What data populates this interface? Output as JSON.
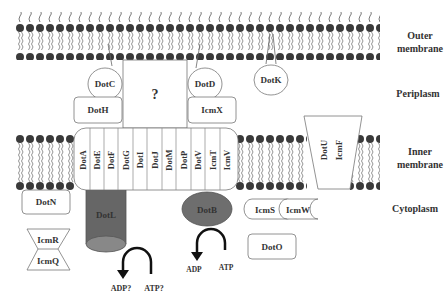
{
  "diagram": {
    "title_hidden": "Dot/Icm type IV secretion system",
    "regions": {
      "outer_membrane_line1": "Outer",
      "outer_membrane_line2": "membrane",
      "periplasm": "Periplasm",
      "inner_membrane_line1": "Inner",
      "inner_membrane_line2": "membrane",
      "cytoplasm": "Cytoplasm"
    },
    "outer_membrane_proteins": {
      "dotc": "DotC",
      "dotd": "DotD",
      "dotk": "DotK"
    },
    "periplasm_proteins": {
      "unknown": "?",
      "doth": "DotH",
      "icmx": "IcmX"
    },
    "inner_membrane_complex": [
      "DotA",
      "DotE",
      "DotF",
      "DotG",
      "DotI",
      "DotJ",
      "DotM",
      "DotP",
      "DotV",
      "IcmT",
      "IcmV"
    ],
    "dotu_icmf": {
      "dotu": "DotU",
      "icmf": "IcmF"
    },
    "cytoplasm_proteins": {
      "dotn": "DotN",
      "icmr": "IcmR",
      "icmq": "IcmQ",
      "dotl": "DotL",
      "dotb": "DotB",
      "icms": "IcmS",
      "icmw": "IcmW",
      "doto": "DotO"
    },
    "reactions": {
      "dotl_product": "ADP?",
      "dotl_substrate": "ATP?",
      "dotb_product": "ADP",
      "dotb_substrate": "ATP"
    },
    "colors": {
      "lipid_head": "#333333",
      "dotl_fill": "#666666",
      "dotb_fill": "#6e6e6e",
      "outline": "#555555"
    }
  }
}
